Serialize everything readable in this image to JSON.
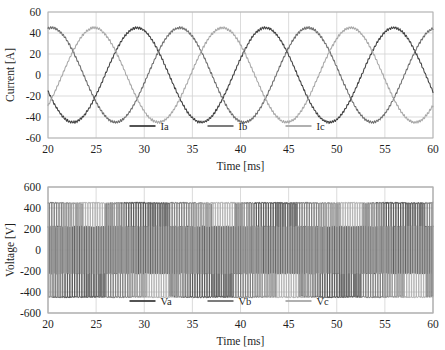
{
  "figure": {
    "title": "",
    "background": "#ffffff",
    "width": 445,
    "height": 350
  },
  "palette": {
    "series_a": "#404040",
    "series_b": "#6e6e6e",
    "series_c": "#a8a8a8",
    "grid": "#d2d2d2",
    "frame": "#b0b0b0",
    "text": "#1f1f1f"
  },
  "chart_data": [
    {
      "id": "current-chart",
      "type": "line",
      "title": "",
      "xlabel": "Time [ms]",
      "ylabel": "Current [A]",
      "xlim": [
        20,
        60
      ],
      "ylim": [
        -60,
        60
      ],
      "xticks": [
        20,
        25,
        30,
        35,
        40,
        45,
        50,
        55,
        60
      ],
      "yticks": [
        60,
        40,
        20,
        0,
        -20,
        -40,
        -60
      ],
      "xtick_labels": [
        "20",
        "25",
        "30",
        "35",
        "40",
        "45",
        "50",
        "55",
        "60"
      ],
      "ytick_labels": [
        "60",
        "40",
        "20",
        "0",
        "-20",
        "-40",
        "-60"
      ],
      "grid": true,
      "legend_position": "inside-bottom-center",
      "waveform": {
        "kind": "three-phase-sine",
        "amplitude": 45,
        "period_ms": 13.33,
        "phase_offset_ms": [
          0,
          4.444,
          8.889
        ],
        "start_phase_deg": -160,
        "ripple_amplitude": 0.9,
        "ripple_period_ms": 0.22
      },
      "series": [
        {
          "name": "Ia",
          "color": "#404040",
          "phase_index": 0,
          "peak": 45,
          "unit": "A"
        },
        {
          "name": "Ib",
          "color": "#6e6e6e",
          "phase_index": 1,
          "peak": 45,
          "unit": "A"
        },
        {
          "name": "Ic",
          "color": "#a8a8a8",
          "phase_index": 2,
          "peak": 45,
          "unit": "A"
        }
      ]
    },
    {
      "id": "voltage-chart",
      "type": "line",
      "title": "",
      "xlabel": "Time [ms]",
      "ylabel": "Voltage [V]",
      "xlim": [
        20,
        60
      ],
      "ylim": [
        -600,
        600
      ],
      "xticks": [
        20,
        25,
        30,
        35,
        40,
        45,
        50,
        55,
        60
      ],
      "yticks": [
        600,
        400,
        200,
        0,
        -200,
        -400,
        -600
      ],
      "xtick_labels": [
        "20",
        "25",
        "30",
        "35",
        "40",
        "45",
        "50",
        "55",
        "60"
      ],
      "ytick_labels": [
        "600",
        "400",
        "200",
        "0",
        "-200",
        "-400",
        "-600"
      ],
      "grid": true,
      "legend_position": "inside-bottom-center",
      "waveform": {
        "kind": "three-phase-pwm",
        "carrier_frequency_khz": 4,
        "levels": [
          -440,
          -220,
          0,
          220,
          440
        ],
        "peak_positive": 450,
        "peak_negative": -450,
        "fundamental_period_ms": 13.33,
        "modulation_index": 0.9,
        "phase_offset_ms": [
          0,
          4.444,
          8.889
        ],
        "start_phase_deg": -160
      },
      "series": [
        {
          "name": "Va",
          "color": "#404040",
          "phase_index": 0,
          "unit": "V"
        },
        {
          "name": "Vb",
          "color": "#6e6e6e",
          "phase_index": 1,
          "unit": "V"
        },
        {
          "name": "Vc",
          "color": "#a8a8a8",
          "phase_index": 2,
          "unit": "V"
        }
      ]
    }
  ]
}
